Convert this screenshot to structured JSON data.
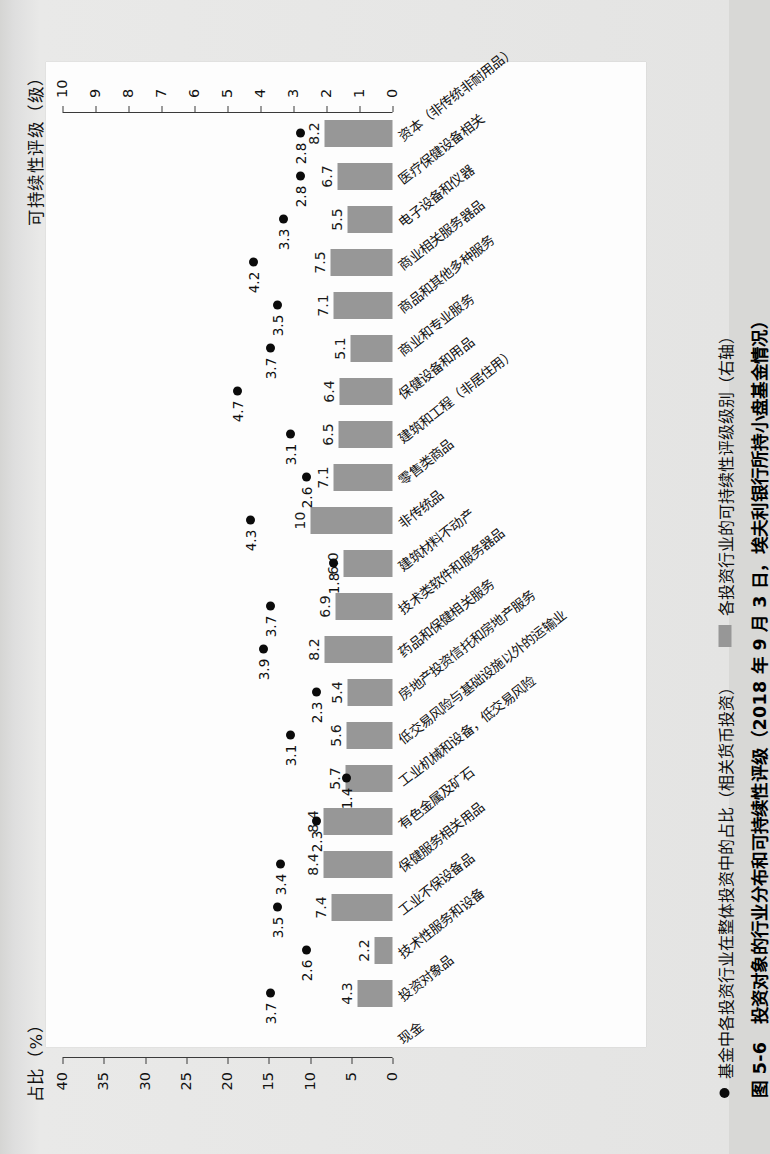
{
  "figure": {
    "caption": "图 5-6　投资对象的行业分布和可持续性评级（2018 年 9 月 3 日，埃夫利银行所持小盘基金情况）",
    "left_axis_title": "占比（%）",
    "right_axis_title": "可持续性评级（级）",
    "x_axis_title": "投资行业"
  },
  "legend": {
    "series1_label": "基金中各投资行业在整体投资中的占比（相关货币投资）",
    "series1_marker": "dot-marker",
    "series2_label": "各投资行业的可持续性评级级别（右轴）",
    "series2_marker": "square-swatch"
  },
  "colors": {
    "bar": "#979797",
    "dot": "#0b0b0b",
    "axis": "#3a3a3a",
    "paper": "#fdfdfd",
    "scan_background": "#dedede"
  },
  "chart_data": {
    "type": "bar",
    "title": "图 5-6　投资对象的行业分布和可持续性评级（2018 年 9 月 3 日，埃夫利银行所持小盘基金情况）",
    "xlabel": "投资行业",
    "ylabel": "占比（%）",
    "y2label": "可持续性评级（级）",
    "ylim": [
      0,
      40
    ],
    "y2lim": [
      0,
      10
    ],
    "yticks": [
      0,
      5,
      10,
      15,
      20,
      25,
      30,
      35,
      40
    ],
    "y2ticks": [
      0,
      1,
      2,
      3,
      4,
      5,
      6,
      7,
      8,
      9,
      10
    ],
    "grid": false,
    "legend_position": "bottom-left",
    "categories": [
      "现金",
      "投资对象品",
      "技术性服务和设备",
      "工业不保设备品",
      "保健服务相关用品",
      "有色金属及矿石",
      "工业机械和设备，低交易风险",
      "低交易风险与基础设施以外的运输业",
      "房地产投资信托和房地产服务",
      "药品和保健相关服务",
      "技术类软件和服务器品",
      "建筑材料不动产",
      "非传统品",
      "零售类商品",
      "建筑和工程（非居住用）",
      "保健设备和用品",
      "商业和专业服务",
      "商品和其他多种服务",
      "商业相关服务器品",
      "电子设备和仪器",
      "医疗保健设备相关",
      "资本（非传统非耐用品）"
    ],
    "series": [
      {
        "name": "基金中各投资行业在整体投资中的占比（相关货币投资）",
        "type": "scatter",
        "axis": "right",
        "values": [
          33.3,
          3.7,
          2.6,
          3.5,
          3.4,
          2.3,
          1.4,
          3.1,
          2.3,
          3.9,
          3.7,
          1.8,
          4.3,
          2.6,
          3.1,
          4.7,
          3.7,
          3.5,
          4.2,
          3.3,
          2.8,
          2.8
        ],
        "labels": [
          "33.3",
          "3.7",
          "2.6",
          "3.5",
          "3.4",
          "2.3",
          "1.4",
          "3.1",
          "2.3",
          "3.9",
          "3.7",
          "1.8",
          "4.3",
          "2.6",
          "3.1",
          "4.7",
          "3.7",
          "3.5",
          "4.2",
          "3.3",
          "2.8",
          "2.8"
        ]
      },
      {
        "name": "各投资行业的可持续性评级级别（右轴）",
        "type": "bar",
        "axis": "left",
        "values": [
          null,
          4.3,
          2.2,
          7.4,
          8.4,
          8.4,
          5.7,
          5.6,
          5.4,
          8.2,
          6.9,
          6.0,
          10,
          7.1,
          6.5,
          6.4,
          5.1,
          7.1,
          7.5,
          5.5,
          6.7,
          8.2
        ],
        "labels": [
          "",
          "4.3",
          "2.2",
          "7.4",
          "8.4",
          "8.4",
          "5.7",
          "5.6",
          "5.4",
          "8.2",
          "6.9",
          "6.0",
          "10",
          "7.1",
          "6.5",
          "6.4",
          "5.1",
          "7.1",
          "7.5",
          "5.5",
          "6.7",
          "8.2"
        ]
      }
    ]
  }
}
